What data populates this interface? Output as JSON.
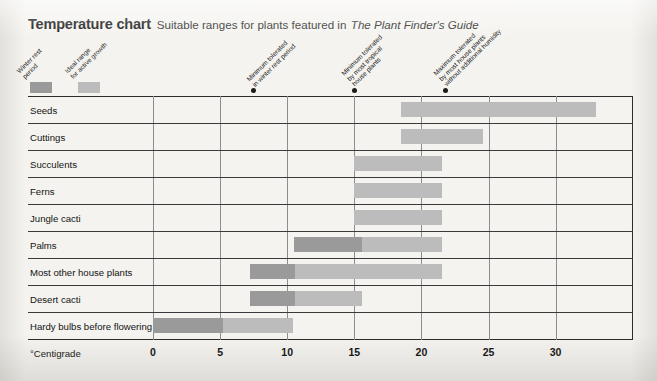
{
  "title": {
    "main": "Temperature chart",
    "subtitle": "Suitable ranges for plants featured in",
    "subtitle_italic": "The Plant Finder's Guide"
  },
  "legend": {
    "items": [
      {
        "label_line1": "Winter rest",
        "label_line2": "period",
        "color": "#9a9a9a"
      },
      {
        "label_line1": "Ideal range",
        "label_line2": "for active growth",
        "color": "#bcbcbc"
      }
    ]
  },
  "callouts": [
    {
      "line1": "Minimum tolerated",
      "line2": "in winter rest period",
      "line3": "",
      "value": 7.5
    },
    {
      "line1": "Minimum tolerated",
      "line2": "by most tropical",
      "line3": "house plants",
      "value": 15
    },
    {
      "line1": "Maximum tolerated",
      "line2": "by most house plants",
      "line3": "without additional humidity",
      "value": 21.8
    }
  ],
  "axis": {
    "title": "°Centigrade",
    "ticks": [
      0,
      5,
      10,
      15,
      20,
      25,
      30
    ],
    "tick_labels": [
      "0",
      "5",
      "10",
      "15",
      "20",
      "25",
      "30"
    ]
  },
  "colors": {
    "winter_rest": "#9a9a9a",
    "ideal_range": "#bcbcbc",
    "grid": "#8d8d8d",
    "rule": "#3a3a3a",
    "page": "#f4f3ef"
  },
  "chart_data": {
    "type": "bar",
    "orientation": "horizontal",
    "title": "Temperature chart",
    "subtitle": "Suitable ranges for plants featured in The Plant Finder's Guide",
    "xlabel": "°Centigrade",
    "ylabel": "",
    "xlim": [
      -1.5,
      35.8
    ],
    "grid": true,
    "legend_position": "top-left",
    "categories": [
      "Seeds",
      "Cuttings",
      "Succulents",
      "Ferns",
      "Jungle cacti",
      "Palms",
      "Most other house plants",
      "Desert cacti",
      "Hardy bulbs before flowering"
    ],
    "series": [
      {
        "name": "Winter rest period",
        "color": "#9a9a9a",
        "ranges": [
          null,
          null,
          null,
          null,
          null,
          [
            10.5,
            15.6
          ],
          [
            7.2,
            10.6
          ],
          [
            7.2,
            10.6
          ],
          [
            0,
            5.2
          ]
        ]
      },
      {
        "name": "Ideal range for active growth",
        "color": "#bcbcbc",
        "ranges": [
          [
            18.5,
            33.0
          ],
          [
            18.5,
            24.6
          ],
          [
            15.0,
            21.5
          ],
          [
            15.0,
            21.5
          ],
          [
            15.0,
            21.5
          ],
          [
            15.6,
            21.5
          ],
          [
            10.6,
            21.5
          ],
          [
            10.6,
            15.6
          ],
          [
            5.2,
            10.4
          ]
        ]
      }
    ],
    "annotations": [
      {
        "text": "Minimum tolerated in winter rest period",
        "x": 7.5
      },
      {
        "text": "Minimum tolerated by most tropical house plants",
        "x": 15
      },
      {
        "text": "Maximum tolerated by most house plants without additional humidity",
        "x": 21.8
      }
    ]
  }
}
